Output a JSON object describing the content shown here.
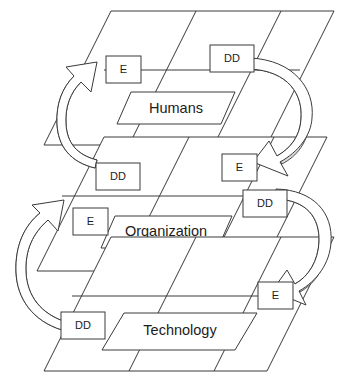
{
  "diagram": {
    "type": "layered-cycle",
    "colors": {
      "stroke": "#3a3a3a",
      "fill": "#ffffff",
      "shade": "#d9d9d9",
      "text": "#1c1c1c"
    },
    "layers": [
      {
        "id": "humans",
        "label": "Humans",
        "order": 1,
        "input_node": "E",
        "output_node": "DD"
      },
      {
        "id": "organization",
        "label": "Organization",
        "order": 2,
        "input_node": "E",
        "output_node": "DD"
      },
      {
        "id": "technology",
        "label": "Technology",
        "order": 3,
        "input_node": "E",
        "output_node": "DD"
      }
    ],
    "nodes": {
      "humans_in": "E",
      "humans_out": "DD",
      "organization_in_left": "E",
      "organization_in_right": "E",
      "organization_out_left": "DD",
      "organization_out_right": "DD",
      "technology_in": "E",
      "technology_out": "DD"
    },
    "node_legend": {
      "E": "E",
      "DD": "DD"
    },
    "connections": [
      {
        "id": "humans-dd-to-org-e",
        "from": "humans_out",
        "to": "organization_in_right",
        "shape": "curve-right-down"
      },
      {
        "id": "org-dd-left-to-humans-e",
        "from": "organization_out_left",
        "to": "humans_in",
        "shape": "curve-left-up"
      },
      {
        "id": "org-dd-right-to-tech-e",
        "from": "organization_out_right",
        "to": "technology_in",
        "shape": "curve-right-down"
      },
      {
        "id": "tech-dd-to-org-e",
        "from": "technology_out",
        "to": "organization_in_left",
        "shape": "curve-left-up"
      }
    ]
  }
}
